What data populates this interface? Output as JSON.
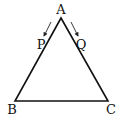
{
  "diagram": {
    "type": "triangle",
    "vertices": {
      "A": {
        "label": "A",
        "x": 61,
        "y": 18,
        "lx": 61,
        "ly": 14
      },
      "B": {
        "label": "B",
        "x": 15,
        "y": 101,
        "lx": 12,
        "ly": 114
      },
      "C": {
        "label": "C",
        "x": 108,
        "y": 101,
        "lx": 111,
        "ly": 114
      }
    },
    "points": {
      "P": {
        "label": "P",
        "lx": 41,
        "ly": 49,
        "on_side": "AB"
      },
      "Q": {
        "label": "Q",
        "lx": 81,
        "ly": 49,
        "on_side": "AC"
      }
    },
    "arrows": [
      {
        "name": "arrow-A-to-P",
        "x1": 51,
        "y1": 22,
        "x2": 44,
        "y2": 36
      },
      {
        "name": "arrow-A-to-Q",
        "x1": 71,
        "y1": 22,
        "x2": 78,
        "y2": 36
      }
    ]
  }
}
